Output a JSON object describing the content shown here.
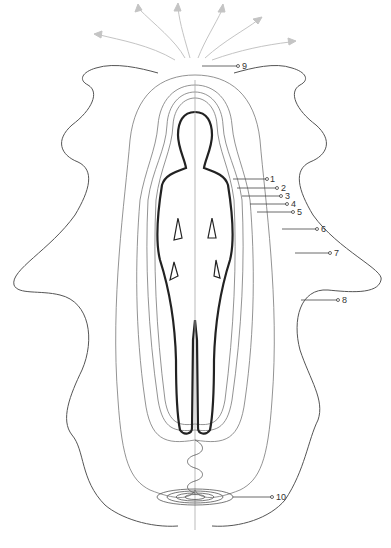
{
  "diagram": {
    "colors": {
      "line": "#666666",
      "body": "#333333",
      "arrows": "#bbbbbb",
      "label": "#333333"
    },
    "labels": [
      {
        "id": 1,
        "text": "1",
        "x": 270,
        "y": 174
      },
      {
        "id": 2,
        "text": "2",
        "x": 281,
        "y": 181
      },
      {
        "id": 3,
        "text": "3",
        "x": 285,
        "y": 190
      },
      {
        "id": 4,
        "text": "4",
        "x": 291,
        "y": 198
      },
      {
        "id": 5,
        "text": "5",
        "x": 297,
        "y": 207
      },
      {
        "id": 6,
        "text": "6",
        "x": 321,
        "y": 225
      },
      {
        "id": 7,
        "text": "7",
        "x": 334,
        "y": 249
      },
      {
        "id": 8,
        "text": "8",
        "x": 342,
        "y": 296
      },
      {
        "id": 9,
        "text": "9",
        "x": 243,
        "y": 62
      },
      {
        "id": 10,
        "text": "10",
        "x": 276,
        "y": 492
      }
    ]
  }
}
